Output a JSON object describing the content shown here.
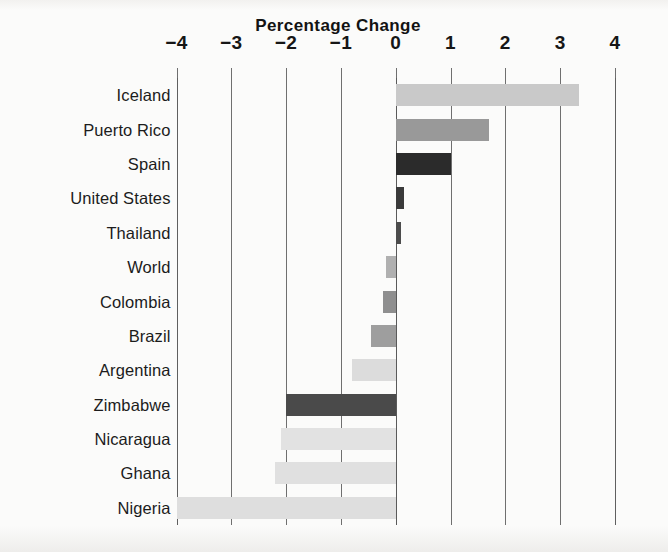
{
  "chart_data": {
    "type": "bar",
    "orientation": "horizontal",
    "title": "Percentage Change",
    "xlabel": "",
    "ylabel": "",
    "xlim": [
      -4,
      4
    ],
    "xticks": [
      -4,
      -3,
      -2,
      -1,
      0,
      1,
      2,
      3,
      4
    ],
    "xtick_labels": [
      "−4",
      "−3",
      "−2",
      "−1",
      "0",
      "1",
      "2",
      "3",
      "4"
    ],
    "grid": true,
    "legend": false,
    "categories": [
      "Iceland",
      "Puerto Rico",
      "Spain",
      "United States",
      "Thailand",
      "World",
      "Colombia",
      "Brazil",
      "Argentina",
      "Zimbabwe",
      "Nicaragua",
      "Ghana",
      "Nigeria"
    ],
    "values": [
      3.35,
      1.7,
      1.0,
      0.15,
      0.1,
      -0.17,
      -0.23,
      -0.45,
      -0.8,
      -2.0,
      -2.1,
      -2.2,
      -4.0
    ],
    "bar_colors": [
      "#c9c9c9",
      "#999999",
      "#2b2b2b",
      "#3a3a3a",
      "#4c4c4c",
      "#b0b0b0",
      "#8f8f8f",
      "#9e9e9e",
      "#dcdcdc",
      "#4a4a4a",
      "#e2e2e2",
      "#e0e0e0",
      "#dedede"
    ]
  },
  "axis": {
    "grid_color": "#6f6f6f",
    "zero_line_color": "#5a5a5a",
    "tick_text_color": "#161616",
    "label_text_color": "#1c1c1c"
  },
  "page": {
    "background": "#fbfbfa"
  }
}
